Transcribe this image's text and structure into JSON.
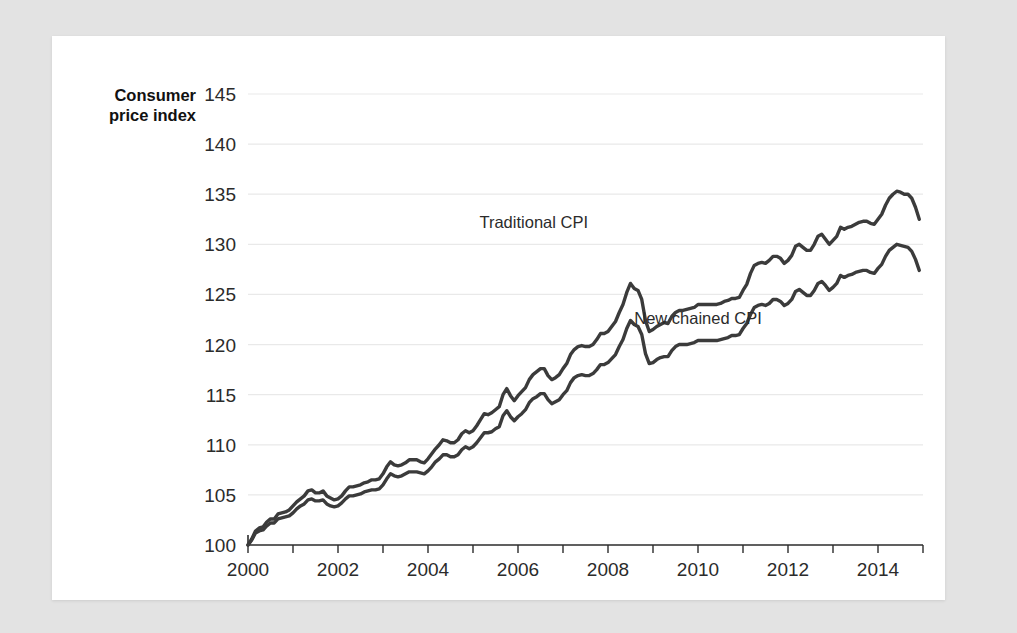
{
  "chart_data": {
    "type": "line",
    "title": "",
    "xlabel": "",
    "ylabel": "Consumer price index",
    "ylabel_line1": "Consumer",
    "ylabel_line2": "price index",
    "xlim": [
      2000,
      2015
    ],
    "ylim": [
      100,
      145
    ],
    "y_ticks": [
      100,
      105,
      110,
      115,
      120,
      125,
      130,
      135,
      140,
      145
    ],
    "y_tick_labels": [
      "100",
      "105",
      "110",
      "115",
      "120",
      "125",
      "130",
      "135",
      "140",
      "145"
    ],
    "x_ticks": [
      2000,
      2002,
      2004,
      2006,
      2008,
      2010,
      2012,
      2014
    ],
    "x_tick_labels": [
      "2000",
      "2002",
      "2004",
      "2006",
      "2008",
      "2010",
      "2012",
      "2014"
    ],
    "x_minor_ticks": [
      2001,
      2003,
      2005,
      2007,
      2009,
      2011,
      2013,
      2015
    ],
    "grid": true,
    "grid_axis": "y",
    "legend": "inline-annotations",
    "line_color": "#3b3b3b",
    "gridline_color": "#e9e9e9",
    "axis_color": "#2b2b2b",
    "card_color": "#ffffff",
    "page_background": "#e3e3e3",
    "annotations": [
      {
        "name": "traditional-cpi-label",
        "text": "Traditional CPI",
        "x": 2006.35,
        "y": 131.6
      },
      {
        "name": "new-chained-cpi-label",
        "text": "New chained CPI",
        "x": 2010.0,
        "y": 122.1
      }
    ],
    "series": [
      {
        "name": "Traditional CPI",
        "color": "#3b3b3b",
        "x": [
          2000.0,
          2000.083,
          2000.167,
          2000.25,
          2000.333,
          2000.417,
          2000.5,
          2000.583,
          2000.667,
          2000.75,
          2000.833,
          2000.917,
          2001.0,
          2001.083,
          2001.167,
          2001.25,
          2001.333,
          2001.417,
          2001.5,
          2001.583,
          2001.667,
          2001.75,
          2001.833,
          2001.917,
          2002.0,
          2002.083,
          2002.167,
          2002.25,
          2002.333,
          2002.417,
          2002.5,
          2002.583,
          2002.667,
          2002.75,
          2002.833,
          2002.917,
          2003.0,
          2003.083,
          2003.167,
          2003.25,
          2003.333,
          2003.417,
          2003.5,
          2003.583,
          2003.667,
          2003.75,
          2003.833,
          2003.917,
          2004.0,
          2004.083,
          2004.167,
          2004.25,
          2004.333,
          2004.417,
          2004.5,
          2004.583,
          2004.667,
          2004.75,
          2004.833,
          2004.917,
          2005.0,
          2005.083,
          2005.167,
          2005.25,
          2005.333,
          2005.417,
          2005.5,
          2005.583,
          2005.667,
          2005.75,
          2005.833,
          2005.917,
          2006.0,
          2006.083,
          2006.167,
          2006.25,
          2006.333,
          2006.417,
          2006.5,
          2006.583,
          2006.667,
          2006.75,
          2006.833,
          2006.917,
          2007.0,
          2007.083,
          2007.167,
          2007.25,
          2007.333,
          2007.417,
          2007.5,
          2007.583,
          2007.667,
          2007.75,
          2007.833,
          2007.917,
          2008.0,
          2008.083,
          2008.167,
          2008.25,
          2008.333,
          2008.417,
          2008.5,
          2008.583,
          2008.667,
          2008.75,
          2008.833,
          2008.917,
          2009.0,
          2009.083,
          2009.167,
          2009.25,
          2009.333,
          2009.417,
          2009.5,
          2009.583,
          2009.667,
          2009.75,
          2009.833,
          2009.917,
          2010.0,
          2010.083,
          2010.167,
          2010.25,
          2010.333,
          2010.417,
          2010.5,
          2010.583,
          2010.667,
          2010.75,
          2010.833,
          2010.917,
          2011.0,
          2011.083,
          2011.167,
          2011.25,
          2011.333,
          2011.417,
          2011.5,
          2011.583,
          2011.667,
          2011.75,
          2011.833,
          2011.917,
          2012.0,
          2012.083,
          2012.167,
          2012.25,
          2012.333,
          2012.417,
          2012.5,
          2012.583,
          2012.667,
          2012.75,
          2012.833,
          2012.917,
          2013.0,
          2013.083,
          2013.167,
          2013.25,
          2013.333,
          2013.417,
          2013.5,
          2013.583,
          2013.667,
          2013.75,
          2013.833,
          2013.917,
          2014.0,
          2014.083,
          2014.167,
          2014.25,
          2014.333,
          2014.417,
          2014.5,
          2014.583,
          2014.667,
          2014.75,
          2014.833,
          2014.917
        ],
        "y": [
          100.0,
          100.6,
          101.4,
          101.7,
          101.8,
          102.3,
          102.6,
          102.6,
          103.1,
          103.2,
          103.3,
          103.5,
          103.9,
          104.3,
          104.6,
          104.9,
          105.4,
          105.5,
          105.2,
          105.2,
          105.4,
          104.9,
          104.7,
          104.5,
          104.6,
          104.9,
          105.4,
          105.8,
          105.8,
          105.9,
          106.0,
          106.2,
          106.3,
          106.5,
          106.5,
          106.6,
          107.1,
          107.8,
          108.3,
          108.0,
          107.9,
          108.0,
          108.2,
          108.5,
          108.5,
          108.5,
          108.3,
          108.2,
          108.6,
          109.1,
          109.6,
          110.0,
          110.5,
          110.4,
          110.2,
          110.2,
          110.5,
          111.1,
          111.4,
          111.2,
          111.4,
          111.9,
          112.5,
          113.1,
          113.0,
          113.2,
          113.5,
          113.8,
          115.0,
          115.6,
          114.9,
          114.4,
          114.9,
          115.3,
          115.7,
          116.5,
          117.0,
          117.3,
          117.6,
          117.6,
          116.9,
          116.5,
          116.7,
          117.0,
          117.6,
          118.1,
          119.0,
          119.5,
          119.8,
          119.9,
          119.8,
          119.8,
          120.0,
          120.5,
          121.1,
          121.1,
          121.3,
          121.8,
          122.3,
          123.2,
          124.0,
          125.2,
          126.1,
          125.6,
          125.4,
          124.5,
          122.4,
          121.3,
          121.5,
          121.8,
          122.0,
          122.2,
          122.1,
          122.8,
          123.2,
          123.4,
          123.4,
          123.5,
          123.6,
          123.7,
          124.0,
          124.0,
          124.0,
          124.0,
          124.0,
          124.0,
          124.1,
          124.3,
          124.4,
          124.6,
          124.6,
          124.7,
          125.4,
          126.0,
          127.1,
          127.9,
          128.1,
          128.2,
          128.1,
          128.4,
          128.8,
          128.8,
          128.6,
          128.1,
          128.4,
          128.9,
          129.8,
          130.0,
          129.7,
          129.4,
          129.4,
          130.0,
          130.8,
          131.0,
          130.5,
          130.0,
          130.4,
          130.8,
          131.7,
          131.5,
          131.7,
          131.8,
          132.0,
          132.2,
          132.3,
          132.3,
          132.1,
          132.0,
          132.5,
          133.0,
          133.9,
          134.6,
          135.0,
          135.3,
          135.2,
          135.0,
          135.0,
          134.6,
          133.7,
          132.5
        ]
      },
      {
        "name": "New chained CPI",
        "color": "#3b3b3b",
        "x": [
          2000.0,
          2000.083,
          2000.167,
          2000.25,
          2000.333,
          2000.417,
          2000.5,
          2000.583,
          2000.667,
          2000.75,
          2000.833,
          2000.917,
          2001.0,
          2001.083,
          2001.167,
          2001.25,
          2001.333,
          2001.417,
          2001.5,
          2001.583,
          2001.667,
          2001.75,
          2001.833,
          2001.917,
          2002.0,
          2002.083,
          2002.167,
          2002.25,
          2002.333,
          2002.417,
          2002.5,
          2002.583,
          2002.667,
          2002.75,
          2002.833,
          2002.917,
          2003.0,
          2003.083,
          2003.167,
          2003.25,
          2003.333,
          2003.417,
          2003.5,
          2003.583,
          2003.667,
          2003.75,
          2003.833,
          2003.917,
          2004.0,
          2004.083,
          2004.167,
          2004.25,
          2004.333,
          2004.417,
          2004.5,
          2004.583,
          2004.667,
          2004.75,
          2004.833,
          2004.917,
          2005.0,
          2005.083,
          2005.167,
          2005.25,
          2005.333,
          2005.417,
          2005.5,
          2005.583,
          2005.667,
          2005.75,
          2005.833,
          2005.917,
          2006.0,
          2006.083,
          2006.167,
          2006.25,
          2006.333,
          2006.417,
          2006.5,
          2006.583,
          2006.667,
          2006.75,
          2006.833,
          2006.917,
          2007.0,
          2007.083,
          2007.167,
          2007.25,
          2007.333,
          2007.417,
          2007.5,
          2007.583,
          2007.667,
          2007.75,
          2007.833,
          2007.917,
          2008.0,
          2008.083,
          2008.167,
          2008.25,
          2008.333,
          2008.417,
          2008.5,
          2008.583,
          2008.667,
          2008.75,
          2008.833,
          2008.917,
          2009.0,
          2009.083,
          2009.167,
          2009.25,
          2009.333,
          2009.417,
          2009.5,
          2009.583,
          2009.667,
          2009.75,
          2009.833,
          2009.917,
          2010.0,
          2010.083,
          2010.167,
          2010.25,
          2010.333,
          2010.417,
          2010.5,
          2010.583,
          2010.667,
          2010.75,
          2010.833,
          2010.917,
          2011.0,
          2011.083,
          2011.167,
          2011.25,
          2011.333,
          2011.417,
          2011.5,
          2011.583,
          2011.667,
          2011.75,
          2011.833,
          2011.917,
          2012.0,
          2012.083,
          2012.167,
          2012.25,
          2012.333,
          2012.417,
          2012.5,
          2012.583,
          2012.667,
          2012.75,
          2012.833,
          2012.917,
          2013.0,
          2013.083,
          2013.167,
          2013.25,
          2013.333,
          2013.417,
          2013.5,
          2013.583,
          2013.667,
          2013.75,
          2013.833,
          2013.917,
          2014.0,
          2014.083,
          2014.167,
          2014.25,
          2014.333,
          2014.417,
          2014.5,
          2014.583,
          2014.667,
          2014.75,
          2014.833,
          2014.917
        ],
        "y": [
          100.0,
          100.5,
          101.2,
          101.4,
          101.5,
          101.9,
          102.2,
          102.2,
          102.6,
          102.7,
          102.8,
          102.9,
          103.2,
          103.6,
          103.9,
          104.1,
          104.5,
          104.6,
          104.4,
          104.4,
          104.5,
          104.1,
          103.9,
          103.8,
          103.9,
          104.2,
          104.6,
          104.9,
          104.9,
          105.0,
          105.1,
          105.3,
          105.4,
          105.5,
          105.5,
          105.6,
          106.0,
          106.6,
          107.1,
          106.9,
          106.8,
          106.9,
          107.1,
          107.3,
          107.3,
          107.3,
          107.2,
          107.1,
          107.4,
          107.8,
          108.3,
          108.6,
          109.0,
          109.0,
          108.8,
          108.8,
          109.0,
          109.5,
          109.8,
          109.6,
          109.8,
          110.2,
          110.7,
          111.2,
          111.2,
          111.3,
          111.6,
          111.8,
          112.9,
          113.4,
          112.8,
          112.4,
          112.8,
          113.1,
          113.5,
          114.2,
          114.6,
          114.8,
          115.1,
          115.1,
          114.5,
          114.1,
          114.3,
          114.5,
          115.0,
          115.4,
          116.2,
          116.7,
          116.9,
          117.0,
          116.9,
          116.9,
          117.1,
          117.5,
          118.0,
          118.0,
          118.2,
          118.6,
          119.0,
          119.8,
          120.5,
          121.6,
          122.4,
          122.0,
          121.8,
          121.0,
          119.1,
          118.1,
          118.2,
          118.5,
          118.7,
          118.8,
          118.8,
          119.4,
          119.8,
          120.0,
          120.0,
          120.0,
          120.1,
          120.2,
          120.4,
          120.4,
          120.4,
          120.4,
          120.4,
          120.4,
          120.5,
          120.6,
          120.7,
          120.9,
          120.9,
          121.0,
          121.6,
          122.1,
          123.0,
          123.7,
          123.9,
          124.0,
          123.9,
          124.1,
          124.5,
          124.5,
          124.3,
          123.9,
          124.1,
          124.5,
          125.3,
          125.5,
          125.2,
          124.9,
          124.9,
          125.4,
          126.1,
          126.3,
          125.9,
          125.4,
          125.7,
          126.1,
          126.9,
          126.7,
          126.9,
          127.0,
          127.2,
          127.3,
          127.4,
          127.4,
          127.2,
          127.1,
          127.6,
          128.0,
          128.8,
          129.4,
          129.7,
          130.0,
          129.9,
          129.8,
          129.7,
          129.3,
          128.5,
          127.4
        ]
      }
    ]
  }
}
